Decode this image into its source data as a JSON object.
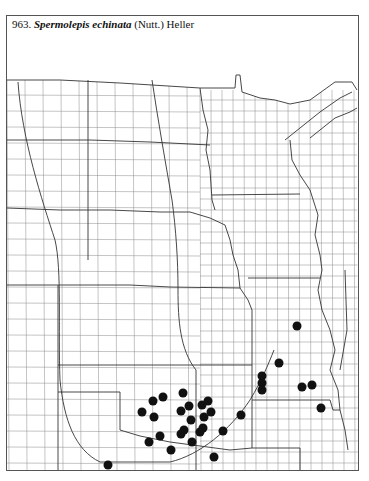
{
  "caption": {
    "number": "963.",
    "species": "Spermolepis echinata",
    "authority": "(Nutt.) Heller"
  },
  "map": {
    "frame": {
      "x": 6,
      "y": 15,
      "w": 353,
      "h": 456
    },
    "line_color": "#777777",
    "state_color": "#333333",
    "dot_color": "#111111",
    "dot_radius": 4.5,
    "occurrences": [
      [
        297,
        326
      ],
      [
        279,
        363
      ],
      [
        262,
        376
      ],
      [
        262,
        383
      ],
      [
        262,
        390
      ],
      [
        312,
        385
      ],
      [
        302,
        387
      ],
      [
        321,
        408
      ],
      [
        183,
        393
      ],
      [
        163,
        397
      ],
      [
        153,
        401
      ],
      [
        142,
        412
      ],
      [
        154,
        417
      ],
      [
        181,
        411
      ],
      [
        189,
        406
      ],
      [
        202,
        405
      ],
      [
        208,
        401
      ],
      [
        211,
        412
      ],
      [
        204,
        417
      ],
      [
        191,
        420
      ],
      [
        184,
        430
      ],
      [
        203,
        428
      ],
      [
        200,
        432
      ],
      [
        181,
        434
      ],
      [
        160,
        436
      ],
      [
        149,
        442
      ],
      [
        192,
        442
      ],
      [
        223,
        431
      ],
      [
        241,
        415
      ],
      [
        171,
        450
      ],
      [
        214,
        457
      ],
      [
        108,
        465
      ]
    ]
  }
}
